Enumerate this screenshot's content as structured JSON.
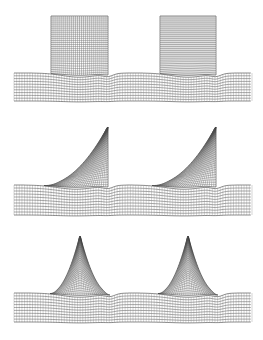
{
  "figure": {
    "background_color": "#ffffff",
    "line_color": "#4a4a4a",
    "outline_color": "#2a2a2a",
    "width": 263,
    "height": 340,
    "panel_count": 3
  },
  "chart_data": {
    "type": "diagram",
    "xlabel": "",
    "ylabel": "",
    "grid": true,
    "legend_position": "none",
    "domain_x": [
      14,
      252
    ],
    "panels": [
      {
        "id": "panel-rectangular",
        "label": "rectangular roughness elements",
        "shape": "rectangle",
        "index": 0,
        "substrate": {
          "x_start": 14,
          "x_end": 252,
          "y_top": 73,
          "y_bottom": 101,
          "horizontal_line_count": 11,
          "vertical_line_count": 90
        },
        "elements": [
          {
            "x_left": 51,
            "x_right": 108,
            "y_top": 16,
            "y_bottom": 73,
            "grid_nx": 28,
            "grid_ny": 28
          },
          {
            "x_left": 160,
            "x_right": 216,
            "y_top": 16,
            "y_bottom": 73,
            "grid_nx": 28,
            "grid_ny": 28
          }
        ]
      },
      {
        "id": "panel-triangular-ramp",
        "label": "right-triangular (ramp) roughness elements",
        "shape": "right-triangle",
        "index": 1,
        "substrate": {
          "x_start": 14,
          "x_end": 252,
          "y_top": 185,
          "y_bottom": 215,
          "horizontal_line_count": 11,
          "vertical_line_count": 90
        },
        "elements": [
          {
            "x_left": 44,
            "x_apex": 108,
            "x_right": 108,
            "y_top": 127,
            "y_bottom": 185,
            "grid_nx": 28,
            "grid_ny": 26
          },
          {
            "x_left": 152,
            "x_apex": 216,
            "x_right": 216,
            "y_top": 127,
            "y_bottom": 185,
            "grid_nx": 28,
            "grid_ny": 26
          }
        ]
      },
      {
        "id": "panel-isoceles-triangular",
        "label": "isoceles-triangular roughness elements",
        "shape": "isoceles-triangle",
        "index": 2,
        "substrate": {
          "x_start": 14,
          "x_end": 252,
          "y_top": 293,
          "y_bottom": 322,
          "horizontal_line_count": 11,
          "vertical_line_count": 90
        },
        "elements": [
          {
            "x_left": 50,
            "x_apex": 80,
            "x_right": 110,
            "y_top": 236,
            "y_bottom": 293,
            "grid_nx": 28,
            "grid_ny": 26
          },
          {
            "x_left": 158,
            "x_apex": 188,
            "x_right": 218,
            "y_top": 236,
            "y_bottom": 293,
            "grid_nx": 28,
            "grid_ny": 26
          }
        ]
      }
    ]
  }
}
